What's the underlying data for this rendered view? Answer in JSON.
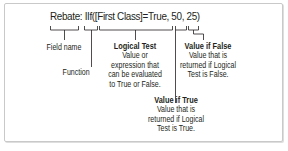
{
  "formula": "Rebate: IIf([First Class]=True, 50, 25)",
  "labels": {
    "field_name": "Field name",
    "function": "Function",
    "logical_test": {
      "title": "Logical Test",
      "lines": [
        "Value or",
        "expression that",
        "can be evaluated",
        "to True or False."
      ]
    },
    "value_if_false": {
      "title": "Value if False",
      "lines": [
        "Value that is",
        "returned if Logical",
        "Test is False."
      ]
    },
    "value_if_true": {
      "title": "Value if True",
      "lines": [
        "Value that is",
        "returned if Logical",
        "Test is True."
      ]
    }
  },
  "colors": {
    "line": "#231f20",
    "frame": "#c9c9c9"
  }
}
